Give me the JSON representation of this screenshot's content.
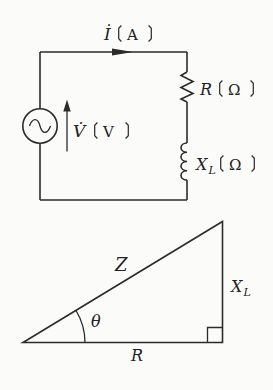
{
  "colors": {
    "background": "#fbfbf9",
    "line": "#2b2b2b",
    "text": "#222222"
  },
  "brackets": {
    "open": "〔",
    "close": "〕"
  },
  "circuit": {
    "current": {
      "symbol": "İ",
      "unit": "A"
    },
    "voltage": {
      "symbol": "V̇",
      "unit": "V"
    },
    "resistor": {
      "symbol": "R",
      "unit": "Ω"
    },
    "inductive_reactance": {
      "symbol": "X",
      "subscript": "L",
      "unit": "Ω"
    }
  },
  "impedance_triangle": {
    "hypotenuse": "Z",
    "angle": "θ",
    "opposite": {
      "symbol": "X",
      "subscript": "L"
    },
    "adjacent": "R"
  }
}
